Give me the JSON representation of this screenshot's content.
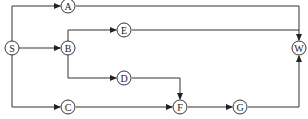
{
  "diagram": {
    "type": "directed-network",
    "nodes": [
      {
        "id": "S",
        "label": "S",
        "x": 12,
        "y": 48
      },
      {
        "id": "A",
        "label": "A",
        "x": 68,
        "y": 6
      },
      {
        "id": "B",
        "label": "B",
        "x": 68,
        "y": 48
      },
      {
        "id": "E",
        "label": "E",
        "x": 124,
        "y": 30
      },
      {
        "id": "D",
        "label": "D",
        "x": 124,
        "y": 78
      },
      {
        "id": "C",
        "label": "C",
        "x": 68,
        "y": 107
      },
      {
        "id": "F",
        "label": "F",
        "x": 180,
        "y": 107
      },
      {
        "id": "G",
        "label": "G",
        "x": 240,
        "y": 107
      },
      {
        "id": "W",
        "label": "W",
        "x": 299,
        "y": 48
      }
    ],
    "edges": [
      {
        "from": "S",
        "to": "A"
      },
      {
        "from": "S",
        "to": "B"
      },
      {
        "from": "S",
        "to": "C"
      },
      {
        "from": "B",
        "to": "E"
      },
      {
        "from": "B",
        "to": "D"
      },
      {
        "from": "A",
        "to": "W"
      },
      {
        "from": "E",
        "to": "W"
      },
      {
        "from": "D",
        "to": "F"
      },
      {
        "from": "C",
        "to": "F"
      },
      {
        "from": "F",
        "to": "G"
      },
      {
        "from": "G",
        "to": "W"
      }
    ]
  }
}
